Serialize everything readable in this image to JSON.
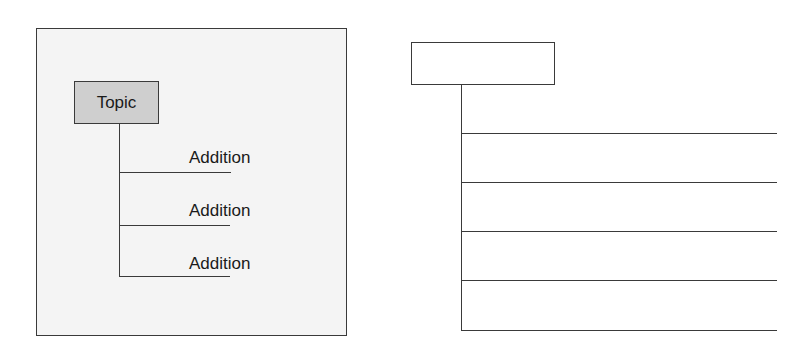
{
  "example_diagram": {
    "topic_label": "Topic",
    "additions": [
      "Addition",
      "Addition",
      "Addition"
    ]
  },
  "blank_template": {
    "topic_label": "",
    "line_count": 5
  },
  "colors": {
    "panel_background": "#f4f4f4",
    "topic_fill": "#cfcfcf",
    "line": "#3a3a3a"
  }
}
